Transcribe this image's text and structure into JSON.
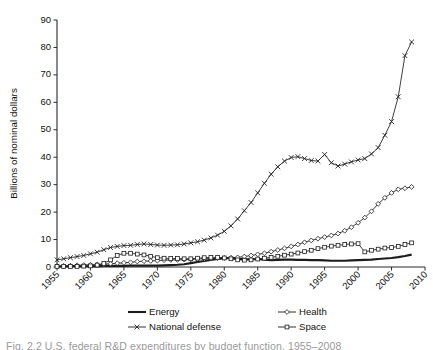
{
  "chart_data": {
    "type": "line",
    "title": "",
    "xlabel": "",
    "ylabel": "Billions of nominal dollars",
    "xlim": [
      1955,
      2010
    ],
    "ylim": [
      0,
      90
    ],
    "ytick_step": 10,
    "xtick_step": 5,
    "grid": false,
    "legend_position": "bottom",
    "yticks": [
      "0",
      "10",
      "20",
      "30",
      "40",
      "50",
      "60",
      "70",
      "80",
      "90"
    ],
    "xticks": [
      "1955",
      "1960",
      "1965",
      "1970",
      "1975",
      "1980",
      "1985",
      "1990",
      "1995",
      "2000",
      "2005",
      "2010"
    ],
    "x": [
      1955,
      1956,
      1957,
      1958,
      1959,
      1960,
      1961,
      1962,
      1963,
      1964,
      1965,
      1966,
      1967,
      1968,
      1969,
      1970,
      1971,
      1972,
      1973,
      1974,
      1975,
      1976,
      1977,
      1978,
      1979,
      1980,
      1981,
      1982,
      1983,
      1984,
      1985,
      1986,
      1987,
      1988,
      1989,
      1990,
      1991,
      1992,
      1993,
      1994,
      1995,
      1996,
      1997,
      1998,
      1999,
      2000,
      2001,
      2002,
      2003,
      2004,
      2005,
      2006,
      2007,
      2008
    ],
    "series": [
      {
        "name": "Energy",
        "marker": "none",
        "values": [
          0.2,
          0.2,
          0.3,
          0.3,
          0.3,
          0.3,
          0.3,
          0.4,
          0.4,
          0.4,
          0.4,
          0.5,
          0.5,
          0.5,
          0.5,
          0.5,
          0.6,
          0.7,
          0.8,
          1.0,
          1.4,
          1.8,
          2.2,
          2.6,
          2.9,
          3.2,
          3.3,
          3.0,
          2.8,
          2.8,
          2.9,
          2.7,
          2.5,
          2.6,
          2.7,
          2.7,
          2.6,
          2.6,
          2.5,
          2.5,
          2.4,
          2.3,
          2.3,
          2.3,
          2.4,
          2.5,
          2.6,
          2.7,
          2.9,
          3.1,
          3.3,
          3.6,
          4.0,
          4.5
        ]
      },
      {
        "name": "Health",
        "marker": "diamond",
        "values": [
          0.3,
          0.4,
          0.5,
          0.6,
          0.7,
          0.8,
          0.9,
          1.0,
          1.2,
          1.4,
          1.5,
          1.7,
          2.0,
          2.1,
          2.2,
          2.3,
          2.5,
          2.6,
          2.6,
          2.7,
          2.8,
          2.9,
          3.0,
          3.1,
          3.2,
          3.3,
          3.4,
          3.5,
          3.8,
          4.2,
          4.6,
          5.0,
          5.6,
          6.2,
          6.8,
          7.5,
          8.2,
          9.0,
          9.7,
          10.3,
          10.9,
          11.5,
          12.2,
          13.2,
          14.5,
          16.1,
          18.0,
          20.3,
          23.0,
          25.2,
          27.0,
          28.3,
          28.7,
          29.2
        ]
      },
      {
        "name": "National defense",
        "marker": "x",
        "values": [
          2.6,
          3.0,
          3.4,
          3.8,
          4.2,
          4.8,
          5.4,
          6.3,
          7.1,
          7.5,
          7.8,
          7.9,
          8.2,
          8.4,
          8.2,
          8.0,
          7.9,
          8.0,
          8.1,
          8.4,
          8.8,
          9.2,
          9.8,
          10.6,
          11.6,
          13.0,
          15.0,
          17.5,
          20.5,
          23.5,
          27.0,
          30.5,
          33.8,
          36.5,
          38.6,
          39.9,
          40.2,
          39.5,
          38.8,
          38.6,
          41.0,
          38.0,
          36.8,
          37.5,
          38.3,
          39.0,
          39.5,
          41.2,
          43.5,
          48.0,
          53.0,
          62.0,
          77.0,
          82.0
        ]
      },
      {
        "name": "Space",
        "marker": "square",
        "values": [
          0.2,
          0.2,
          0.2,
          0.2,
          0.3,
          0.4,
          0.7,
          1.3,
          2.6,
          4.2,
          5.0,
          5.0,
          4.7,
          4.4,
          3.9,
          3.4,
          3.2,
          3.1,
          3.1,
          3.0,
          3.0,
          3.2,
          3.4,
          3.5,
          3.5,
          3.3,
          3.0,
          2.6,
          2.5,
          2.6,
          2.9,
          3.2,
          3.5,
          3.9,
          4.3,
          4.7,
          5.1,
          5.6,
          6.1,
          6.7,
          7.2,
          7.6,
          7.9,
          8.2,
          8.4,
          8.5,
          5.5,
          6.1,
          6.5,
          6.9,
          7.1,
          7.5,
          8.2,
          8.8
        ]
      }
    ]
  },
  "legend": {
    "items": [
      {
        "label": "Energy",
        "marker": "none"
      },
      {
        "label": "Health",
        "marker": "diamond"
      },
      {
        "label": "National defense",
        "marker": "x"
      },
      {
        "label": "Space",
        "marker": "square"
      }
    ]
  },
  "caption": {
    "text": "Fig. 2.2   U.S. federal R&D expenditures by budget function, 1955–2008"
  },
  "colors": {
    "line": "#1c1c1c",
    "axis": "#2b2b2b",
    "text": "#111111",
    "background": "#ffffff"
  }
}
